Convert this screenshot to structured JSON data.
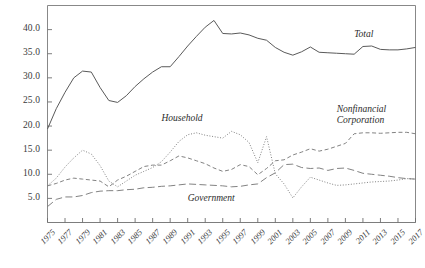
{
  "figure": {
    "background": "#ffffff",
    "frame_color": "#7a7a7a",
    "axis_color": "#6e6e6e",
    "text_color": "#3a3a3a"
  },
  "chart_data": {
    "type": "line",
    "title": "",
    "subtitle": "",
    "xlabel": "",
    "ylabel": "",
    "grid": false,
    "legend_position": "inline-annotations",
    "xlim": [
      1975,
      2017
    ],
    "ylim": [
      0.0,
      45.0
    ],
    "yticks": [
      "5.0",
      "10.0",
      "15.0",
      "20.0",
      "25.0",
      "30.0",
      "35.0",
      "40.0"
    ],
    "ytick_values": [
      5.0,
      10.0,
      15.0,
      20.0,
      25.0,
      30.0,
      35.0,
      40.0
    ],
    "xticks": [
      "1975",
      "1977",
      "1979",
      "1981",
      "1983",
      "1985",
      "1987",
      "1989",
      "1991",
      "1993",
      "1995",
      "1997",
      "1999",
      "2001",
      "2003",
      "2005",
      "2007",
      "2009",
      "2011",
      "2013",
      "2015",
      "2017"
    ],
    "xtick_values": [
      1975,
      1977,
      1979,
      1981,
      1983,
      1985,
      1987,
      1989,
      1991,
      1993,
      1995,
      1997,
      1999,
      2001,
      2003,
      2005,
      2007,
      2009,
      2011,
      2013,
      2015,
      2017
    ],
    "x": [
      1975,
      1976,
      1977,
      1978,
      1979,
      1980,
      1981,
      1982,
      1983,
      1984,
      1985,
      1986,
      1987,
      1988,
      1989,
      1990,
      1991,
      1992,
      1993,
      1994,
      1995,
      1996,
      1997,
      1998,
      1999,
      2000,
      2001,
      2002,
      2003,
      2004,
      2005,
      2006,
      2007,
      2008,
      2009,
      2010,
      2011,
      2012,
      2013,
      2014,
      2015,
      2016,
      2017
    ],
    "series": [
      {
        "name": "Total",
        "style": "solid",
        "color": "#5a5a5a",
        "label": "Total",
        "values": [
          19.4,
          23.6,
          27.0,
          30.0,
          31.4,
          31.2,
          28.0,
          25.3,
          24.9,
          26.3,
          28.2,
          29.8,
          31.2,
          32.3,
          32.3,
          34.4,
          36.6,
          38.6,
          40.5,
          41.9,
          39.2,
          39.1,
          39.3,
          38.9,
          38.2,
          37.8,
          36.3,
          35.3,
          34.7,
          35.4,
          36.4,
          35.3,
          35.2,
          35.1,
          35.0,
          34.9,
          36.5,
          36.6,
          35.9,
          35.8,
          35.8,
          36.0,
          36.3
        ]
      },
      {
        "name": "Household",
        "style": "dotted",
        "color": "#7b7b7b",
        "label": "Household",
        "values": [
          7.6,
          9.2,
          11.5,
          13.4,
          15.0,
          14.2,
          11.8,
          8.6,
          7.4,
          8.6,
          9.8,
          10.6,
          11.4,
          12.6,
          14.6,
          16.8,
          18.2,
          18.6,
          18.1,
          17.8,
          17.5,
          18.9,
          18.2,
          16.6,
          12.4,
          17.8,
          10.1,
          8.0,
          5.1,
          7.4,
          9.4,
          8.8,
          8.2,
          7.7,
          7.8,
          8.0,
          8.2,
          8.4,
          8.5,
          8.6,
          8.8,
          9.1,
          9.0
        ]
      },
      {
        "name": "Nonfinancial Corporation",
        "style": "dashed",
        "color": "#7b7b7b",
        "label": "Nonfinancial Corporation",
        "label_line1": "Nonfinancial",
        "label_line2": "Corporation",
        "values": [
          7.6,
          8.1,
          8.8,
          9.2,
          9.0,
          8.8,
          8.6,
          7.4,
          8.8,
          9.6,
          10.6,
          11.6,
          11.9,
          11.9,
          12.8,
          13.8,
          13.4,
          12.8,
          12.2,
          11.3,
          10.6,
          11.0,
          12.0,
          11.6,
          9.9,
          11.2,
          12.8,
          13.0,
          14.0,
          14.6,
          15.3,
          14.8,
          15.2,
          15.8,
          16.4,
          18.4,
          18.6,
          18.6,
          18.5,
          18.6,
          18.7,
          18.7,
          18.4
        ]
      },
      {
        "name": "Government",
        "style": "longdash",
        "color": "#7b7b7b",
        "label": "Government",
        "values": [
          3.3,
          4.8,
          5.3,
          5.3,
          5.6,
          6.2,
          6.5,
          6.6,
          6.6,
          6.8,
          6.9,
          7.2,
          7.3,
          7.5,
          7.6,
          7.8,
          8.0,
          7.9,
          7.8,
          7.7,
          7.6,
          7.4,
          7.5,
          7.8,
          8.0,
          9.3,
          10.3,
          12.0,
          12.1,
          11.4,
          11.2,
          11.3,
          10.8,
          11.2,
          11.3,
          10.8,
          10.2,
          10.0,
          9.8,
          9.6,
          9.3,
          9.1,
          9.0
        ]
      }
    ],
    "annotations": [
      {
        "text": "Total",
        "x": 2010,
        "y": 38.6
      },
      {
        "text": "Household",
        "x": 1988,
        "y": 21.2
      },
      {
        "text": "Nonfinancial",
        "x": 2008,
        "y": 23.2
      },
      {
        "text": "Corporation",
        "x": 2008,
        "y": 20.8
      },
      {
        "text": "Government",
        "x": 1991,
        "y": 4.6
      }
    ]
  }
}
